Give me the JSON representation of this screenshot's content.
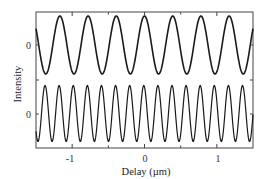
{
  "chart_data": {
    "type": "line",
    "title": "",
    "xlabel": "Delay (µm)",
    "ylabel": "Intensity",
    "xlim": [
      -1.5,
      1.5
    ],
    "x_ticks": [
      -1,
      0,
      1
    ],
    "x_tick_labels": [
      "-1",
      "0",
      "1"
    ],
    "x_minor_ticks": [
      -1.5,
      -0.5,
      0.5,
      1.5
    ],
    "y_tick_labels": [
      "0",
      "0"
    ],
    "grid": false,
    "legend": null,
    "series": [
      {
        "name": "upper trace (fundamental interferogram)",
        "offset_label": "0",
        "period_um": 0.39,
        "phase_peak_at_um": 0.0,
        "amplitude": 1.0,
        "baseline": 0,
        "x": [
          -1.5,
          -1.365,
          -1.17,
          -0.975,
          -0.78,
          -0.585,
          -0.39,
          -0.195,
          0.0,
          0.195,
          0.39,
          0.585,
          0.78,
          0.975,
          1.17,
          1.365,
          1.5
        ],
        "values": [
          0.67,
          -1.0,
          1.0,
          -1.0,
          1.0,
          -1.0,
          1.0,
          -1.0,
          1.0,
          -1.0,
          1.0,
          -1.0,
          1.0,
          -1.0,
          1.0,
          -1.0,
          0.67
        ]
      },
      {
        "name": "lower trace (second-harmonic interferogram)",
        "offset_label": "0",
        "period_um": 0.195,
        "phase_peak_at_um": -0.01,
        "amplitude": 1.0,
        "baseline": 0,
        "x": [
          -1.5,
          -1.375,
          -1.28,
          -1.18,
          -1.085,
          -0.99,
          -0.89,
          -0.795,
          -0.7,
          -0.6,
          -0.5,
          -0.405,
          -0.31,
          -0.21,
          -0.11,
          -0.01,
          0.085,
          0.18,
          0.28,
          0.38,
          0.47,
          0.565,
          0.67,
          0.76,
          0.86,
          0.96,
          1.05,
          1.15,
          1.25,
          1.34,
          1.45,
          1.5
        ],
        "values": [
          -0.9,
          1.0,
          -1.0,
          0.9,
          -1.0,
          0.95,
          -1.0,
          0.9,
          -1.0,
          1.0,
          -0.95,
          0.9,
          -0.95,
          0.95,
          -0.9,
          1.0,
          -1.0,
          0.95,
          -0.9,
          0.95,
          -0.95,
          0.9,
          -0.9,
          0.95,
          -0.9,
          0.9,
          -0.95,
          0.95,
          -0.9,
          0.9,
          -0.9,
          -0.85
        ]
      }
    ]
  },
  "labels": {
    "xlabel": "Delay (µm)",
    "ylabel": "Intensity",
    "x_tick_minus1": "-1",
    "x_tick_0": "0",
    "x_tick_1": "1",
    "y_tick_upper": "0",
    "y_tick_lower": "0"
  }
}
